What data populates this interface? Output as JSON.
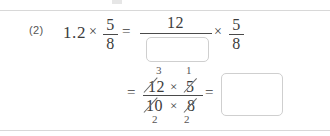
{
  "worksheet": {
    "problem_number": "(2)",
    "line1": {
      "expression_left": "1.2",
      "times_1": "×",
      "fraction_left": {
        "numerator": "5",
        "denominator": "8"
      },
      "equals_1": "=",
      "big_fraction_numerator": "12",
      "big_fraction_denominator_answer": "",
      "times_2": "×",
      "fraction_right": {
        "numerator": "5",
        "denominator": "8"
      }
    },
    "line2": {
      "equals_2": "=",
      "numerator_terms": [
        "12",
        "5"
      ],
      "numerator_times": "×",
      "denominator_terms": [
        "10",
        "8"
      ],
      "denominator_times": "×",
      "cancel_above": [
        "3",
        "1"
      ],
      "cancel_below": [
        "2",
        "2"
      ],
      "equals_3": "=",
      "final_answer": ""
    }
  },
  "colors": {
    "ink": "#3c3c3c",
    "rule": "#d8d8d8",
    "box_border": "#cfcfcf",
    "background": "#ffffff"
  }
}
